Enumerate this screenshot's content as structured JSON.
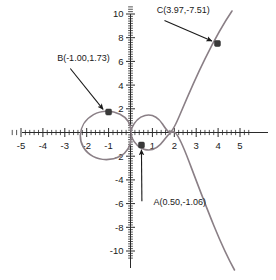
{
  "chart_data": {
    "type": "line",
    "title": "",
    "xlabel": "",
    "ylabel": "",
    "xlim": [
      -5.6,
      5.6
    ],
    "ylim": [
      -11,
      11
    ],
    "grid": false,
    "legend": null,
    "x_ticks": [
      "-5",
      "-4",
      "-3",
      "-2",
      "-1",
      "1",
      "2",
      "3",
      "4",
      "5"
    ],
    "x_tick_values": [
      -5,
      -4,
      -3,
      -2,
      -1,
      1,
      2,
      3,
      4,
      5
    ],
    "y_ticks": [
      "10",
      "8",
      "6",
      "4",
      "2",
      "-2",
      "-4",
      "-6",
      "-8",
      "-10"
    ],
    "y_tick_values": [
      10,
      8,
      6,
      4,
      2,
      -2,
      -4,
      -6,
      -8,
      -10
    ],
    "minor_tick_step": 0.2,
    "curve_color": "#8a7f86",
    "axis_color": "#2a2a2a",
    "annotated_points": [
      {
        "name": "A",
        "label": "A(0.50,-1.06)",
        "x": 0.5,
        "y": -1.06,
        "label_x": 1.05,
        "label_y": -6.15,
        "arrow_from_x": 0.52,
        "arrow_from_y": -5.8,
        "arrow_to_x": 0.5,
        "arrow_to_y": -1.45
      },
      {
        "name": "B",
        "label": "B(-1.00,1.73)",
        "x": -1.0,
        "y": 1.73,
        "label_x": -3.35,
        "label_y": 6.05,
        "arrow_from_x": -2.75,
        "arrow_from_y": 5.4,
        "arrow_to_x": -1.25,
        "arrow_to_y": 1.95
      },
      {
        "name": "C",
        "label": "C(3.97,-7.51)",
        "x": 3.97,
        "y": 7.51,
        "label_x": 1.2,
        "label_y": 10.05,
        "arrow_from_x": 1.55,
        "arrow_from_y": 9.45,
        "arrow_to_x": 3.72,
        "arrow_to_y": 7.72
      }
    ],
    "oval_branch": {
      "comment": "closed loop left component spanning roughly x in [-1.95, 0.0]",
      "x_min": -1.95,
      "x_max": 0.0
    },
    "open_branch": {
      "comment": "right component rising through C and falling into lower right",
      "x_min": 0.3,
      "x_max": 5.3
    }
  }
}
